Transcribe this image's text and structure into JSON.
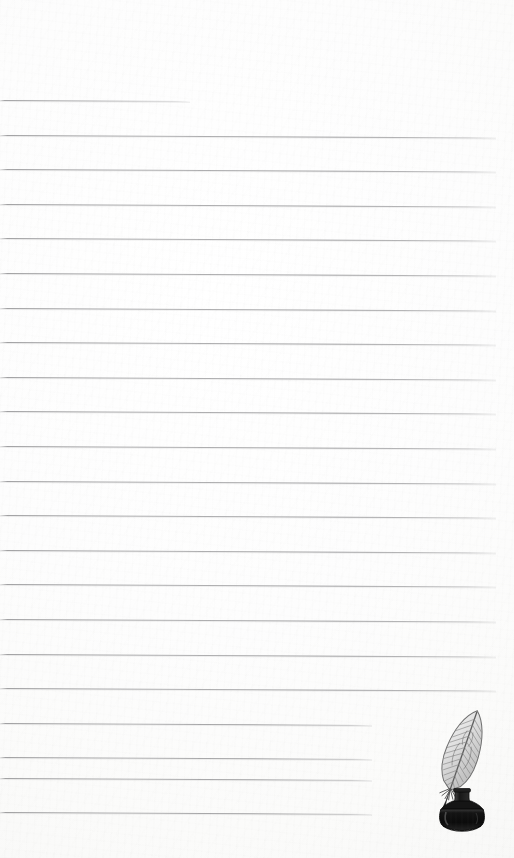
{
  "page": {
    "kind": "lined-notepaper",
    "width": 514,
    "height": 858,
    "paper_color": "#fdfdfc",
    "rule_color": "#96969a",
    "ink_color": "#1b1b1b",
    "title": "",
    "body_text": ""
  },
  "rules": {
    "count": 22,
    "first_line_y": 100,
    "spacing": 34.6,
    "default_left": 0,
    "default_right": 496,
    "slant_deg": 0.3,
    "lines": [
      {
        "id": "rule-1",
        "y": 100,
        "x1": 0,
        "x2": 190,
        "text": ""
      },
      {
        "id": "rule-2",
        "y": 134.6,
        "x1": 0,
        "x2": 496,
        "text": ""
      },
      {
        "id": "rule-3",
        "y": 169.2,
        "x1": 0,
        "x2": 496,
        "text": ""
      },
      {
        "id": "rule-4",
        "y": 203.8,
        "x1": 0,
        "x2": 496,
        "text": ""
      },
      {
        "id": "rule-5",
        "y": 238.4,
        "x1": 0,
        "x2": 496,
        "text": ""
      },
      {
        "id": "rule-6",
        "y": 273.0,
        "x1": 0,
        "x2": 496,
        "text": ""
      },
      {
        "id": "rule-7",
        "y": 307.6,
        "x1": 0,
        "x2": 496,
        "text": ""
      },
      {
        "id": "rule-8",
        "y": 342.2,
        "x1": 0,
        "x2": 496,
        "text": ""
      },
      {
        "id": "rule-9",
        "y": 376.8,
        "x1": 0,
        "x2": 496,
        "text": ""
      },
      {
        "id": "rule-10",
        "y": 411.4,
        "x1": 0,
        "x2": 496,
        "text": ""
      },
      {
        "id": "rule-11",
        "y": 446.0,
        "x1": 0,
        "x2": 496,
        "text": ""
      },
      {
        "id": "rule-12",
        "y": 480.6,
        "x1": 0,
        "x2": 496,
        "text": ""
      },
      {
        "id": "rule-13",
        "y": 515.2,
        "x1": 0,
        "x2": 496,
        "text": ""
      },
      {
        "id": "rule-14",
        "y": 549.8,
        "x1": 0,
        "x2": 496,
        "text": ""
      },
      {
        "id": "rule-15",
        "y": 584.4,
        "x1": 0,
        "x2": 496,
        "text": ""
      },
      {
        "id": "rule-16",
        "y": 619.0,
        "x1": 0,
        "x2": 496,
        "text": ""
      },
      {
        "id": "rule-17",
        "y": 653.6,
        "x1": 0,
        "x2": 496,
        "text": ""
      },
      {
        "id": "rule-18",
        "y": 688.2,
        "x1": 0,
        "x2": 496,
        "text": ""
      },
      {
        "id": "rule-19",
        "y": 722.8,
        "x1": 0,
        "x2": 372,
        "text": ""
      },
      {
        "id": "rule-20",
        "y": 757.4,
        "x1": 0,
        "x2": 372,
        "text": ""
      },
      {
        "id": "rule-21",
        "y": 778.0,
        "x1": 0,
        "x2": 372,
        "text": ""
      },
      {
        "id": "rule-22",
        "y": 812.0,
        "x1": 0,
        "x2": 372,
        "text": ""
      }
    ]
  },
  "illustration": {
    "name": "quill-pen-inkwell-illustration",
    "style": "engraving",
    "x": 418,
    "y": 706,
    "width": 88,
    "height": 128,
    "feather_color": "#8d8d8d",
    "bottle_color": "#1c1c1c",
    "caption": ""
  }
}
